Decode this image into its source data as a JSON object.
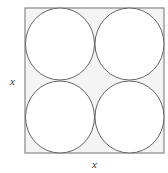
{
  "diagram": {
    "labels": {
      "left": "x",
      "bottom": "x"
    },
    "square": {
      "x": 25,
      "y": 8,
      "size": 140,
      "fill": "#f4f4f4",
      "stroke": "#888888"
    },
    "circles": [
      {
        "cx": 60,
        "cy": 43,
        "r": 35
      },
      {
        "cx": 130,
        "cy": 43,
        "r": 35
      },
      {
        "cx": 60,
        "cy": 118,
        "r": 35
      },
      {
        "cx": 130,
        "cy": 118,
        "r": 35
      }
    ],
    "circle_fill": "#ffffff",
    "circle_stroke": "#666666"
  }
}
